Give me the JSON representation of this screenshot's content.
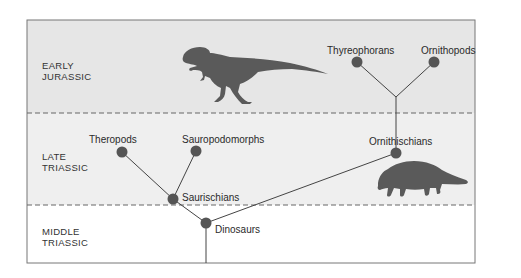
{
  "colors": {
    "band_top": "#e6e6e6",
    "band_mid": "#efefef",
    "band_bottom": "#ffffff",
    "frame": "#777777",
    "node": "#555555",
    "line": "#444444",
    "silhouette": "#5a5a5a"
  },
  "periods": [
    {
      "id": "early-jurassic",
      "line1": "EARLY",
      "line2": "JURASSIC"
    },
    {
      "id": "late-triassic",
      "line1": "LATE",
      "line2": "TRIASSIC"
    },
    {
      "id": "middle-triassic",
      "line1": "MIDDLE",
      "line2": "TRIASSIC"
    }
  ],
  "nodes": {
    "thyreophorans": {
      "label": "Thyreophorans",
      "x": 357,
      "y": 62
    },
    "ornithopods": {
      "label": "Ornithopods",
      "x": 434,
      "y": 62
    },
    "ornithischians": {
      "label": "Ornithischians",
      "x": 396,
      "y": 153
    },
    "theropods": {
      "label": "Theropods",
      "x": 122,
      "y": 152
    },
    "sauropodomorphs": {
      "label": "Sauropodomorphs",
      "x": 196,
      "y": 151
    },
    "saurischians": {
      "label": "Saurischians",
      "x": 173,
      "y": 199
    },
    "dinosaurs": {
      "label": "Dinosaurs",
      "x": 206,
      "y": 223
    }
  },
  "illustrations": [
    {
      "id": "theropod-silhouette",
      "desc": "T-rex-like theropod"
    },
    {
      "id": "ankylosaur-silhouette",
      "desc": "armored ornithischian"
    }
  ]
}
